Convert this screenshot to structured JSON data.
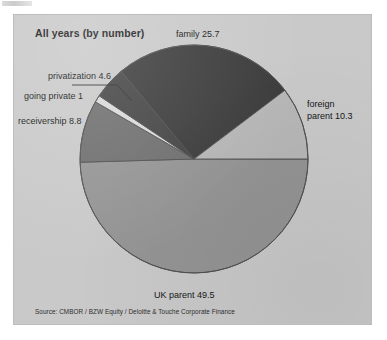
{
  "chart_data": {
    "type": "pie",
    "title": "All years (by number)",
    "source": "Source: CMBOR / BZW Equity / Deloitte & Touche Corporate Finance",
    "unit": "%",
    "legend_position": "outside-labels",
    "grid": false,
    "categories": [
      "family",
      "foreign parent",
      "UK parent",
      "receivership",
      "going private",
      "privatization"
    ],
    "values": [
      25.7,
      10.3,
      49.5,
      8.8,
      1,
      4.6
    ],
    "labels": [
      "family 25.7",
      "foreign\nparent 10.3",
      "UK parent 49.5",
      "receivership 8.8",
      "going private 1",
      "privatization 4.6"
    ],
    "colors": [
      "#3b3b3b",
      "#b7b7b7",
      "#949494",
      "#6e6e6e",
      "#d8d8d8",
      "#434343"
    ],
    "xlabel": "",
    "ylabel": ""
  },
  "panel": {
    "title": "All years (by number)",
    "source": "Source: CMBOR / BZW Equity / Deloitte & Touche Corporate Finance"
  },
  "labels": {
    "family": "family 25.7",
    "foreign_line1": "foreign",
    "foreign_line2": "parent 10.3",
    "uk_parent": "UK parent 49.5",
    "receivership": "receivership 8.8",
    "going_private": "going private 1",
    "privatization": "privatization 4.6"
  },
  "colors": {
    "panel_background": "#c9c9c9",
    "family_slice": "#3b3b3b",
    "foreign_parent_slice": "#b7b7b7",
    "uk_parent_slice": "#949494",
    "receivership_slice": "#6e6e6e",
    "going_private_slice": "#d8d8d8",
    "privatization_slice": "#434343",
    "outline": "#4a4a4a",
    "text": "#161616"
  }
}
